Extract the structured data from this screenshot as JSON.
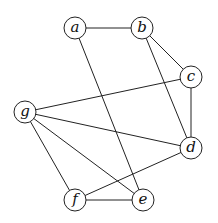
{
  "graph": {
    "node_radius": 11,
    "nodes": [
      {
        "id": "a",
        "label": "a",
        "x": 75,
        "y": 28
      },
      {
        "id": "b",
        "label": "b",
        "x": 142,
        "y": 28
      },
      {
        "id": "c",
        "label": "c",
        "x": 191,
        "y": 77
      },
      {
        "id": "d",
        "label": "d",
        "x": 191,
        "y": 148
      },
      {
        "id": "e",
        "label": "e",
        "x": 143,
        "y": 200
      },
      {
        "id": "f",
        "label": "f",
        "x": 75,
        "y": 200
      },
      {
        "id": "g",
        "label": "g",
        "x": 25,
        "y": 112
      }
    ],
    "edges": [
      [
        "a",
        "b"
      ],
      [
        "a",
        "e"
      ],
      [
        "b",
        "c"
      ],
      [
        "b",
        "d"
      ],
      [
        "c",
        "d"
      ],
      [
        "c",
        "g"
      ],
      [
        "g",
        "d"
      ],
      [
        "g",
        "f"
      ],
      [
        "g",
        "e"
      ],
      [
        "f",
        "e"
      ],
      [
        "f",
        "d"
      ]
    ]
  }
}
